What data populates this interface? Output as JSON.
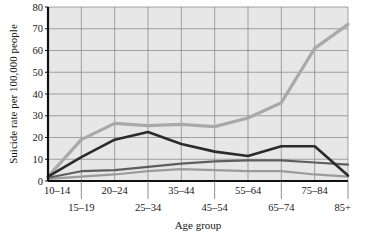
{
  "chart_data": {
    "type": "line",
    "title": "",
    "xlabel": "Age group",
    "ylabel": "Suicide rate per 100,000 people",
    "categories": [
      "10–14",
      "15–19",
      "20–24",
      "25–34",
      "35–44",
      "45–54",
      "55–64",
      "65–74",
      "75–84",
      "85+"
    ],
    "ylim": [
      0,
      80
    ],
    "yticks": [
      0,
      10,
      20,
      30,
      40,
      50,
      60,
      70,
      80
    ],
    "ytick_labels": [
      "0",
      "10",
      "20",
      "30",
      "40",
      "50",
      "60",
      "70",
      "80"
    ],
    "grid": true,
    "legend": "none",
    "plot_background": "#e7e7e7",
    "grid_color": "#808080",
    "axis_color": "#111111",
    "series": [
      {
        "name": "series-1",
        "color": "#a9a9a9",
        "width": 3.2,
        "values": [
          2,
          19,
          26.5,
          25.5,
          26,
          25,
          29,
          36,
          61,
          72
        ]
      },
      {
        "name": "series-2",
        "color": "#2b2b2b",
        "width": 2.6,
        "values": [
          2,
          11,
          19,
          22.5,
          17,
          13.5,
          11.5,
          16,
          16,
          2.5
        ]
      },
      {
        "name": "series-3",
        "color": "#5e5e5e",
        "width": 2.2,
        "values": [
          1.5,
          4.5,
          5,
          6.5,
          8,
          9,
          9.5,
          9.5,
          8.5,
          7.5
        ]
      },
      {
        "name": "series-4",
        "color": "#9b9b9b",
        "width": 2.2,
        "values": [
          1,
          2,
          3,
          4.5,
          5.5,
          5,
          4.5,
          4.5,
          3,
          2
        ]
      }
    ]
  },
  "xaxis_rows": {
    "top": [
      "10–14",
      "20–24",
      "35–44",
      "55–64",
      "75–84"
    ],
    "bottom": [
      "15–19",
      "25–34",
      "45–54",
      "65–74",
      "85+"
    ]
  }
}
